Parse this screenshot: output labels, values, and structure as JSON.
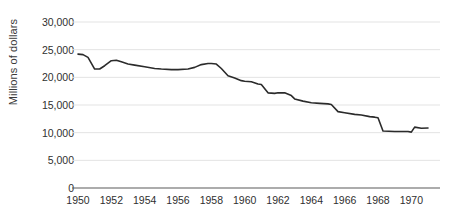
{
  "chart_data": {
    "type": "line",
    "title": "",
    "xlabel": "",
    "ylabel": "Millions of dollars",
    "xlim": [
      1950,
      1971
    ],
    "ylim": [
      0,
      30000
    ],
    "yticks": [
      0,
      5000,
      10000,
      15000,
      20000,
      25000,
      30000
    ],
    "ytick_labels": [
      "0",
      "5,000",
      "10,000",
      "15,000",
      "20,000",
      "25,000",
      "30,000"
    ],
    "xticks": [
      1950,
      1952,
      1954,
      1956,
      1958,
      1960,
      1962,
      1964,
      1966,
      1968,
      1970
    ],
    "xtick_labels": [
      "1950",
      "1952",
      "1954",
      "1956",
      "1958",
      "1960",
      "1962",
      "1964",
      "1966",
      "1968",
      "1970"
    ],
    "grid": "horizontal",
    "legend": "none",
    "line_color": "#2b2b2b",
    "grid_color": "#e3e3e3",
    "axis_color": "#5a5a5a",
    "series": [
      {
        "name": "Millions of dollars",
        "x": [
          1950.0,
          1950.3,
          1950.6,
          1951.0,
          1951.3,
          1951.6,
          1952.0,
          1952.3,
          1952.6,
          1953.0,
          1953.4,
          1954.0,
          1954.6,
          1955.0,
          1955.6,
          1956.0,
          1956.6,
          1957.0,
          1957.4,
          1957.8,
          1958.0,
          1958.3,
          1958.6,
          1959.0,
          1959.4,
          1959.8,
          1960.0,
          1960.4,
          1960.8,
          1961.0,
          1961.4,
          1961.8,
          1962.0,
          1962.4,
          1962.8,
          1963.0,
          1963.5,
          1964.0,
          1964.5,
          1965.0,
          1965.2,
          1965.6,
          1966.0,
          1966.6,
          1967.0,
          1967.5,
          1967.8,
          1968.0,
          1968.3,
          1969.0,
          1969.8,
          1970.0,
          1970.2,
          1970.6,
          1971.0
        ],
        "y": [
          24200,
          24100,
          23600,
          21500,
          21500,
          22100,
          23000,
          23100,
          22800,
          22400,
          22200,
          21900,
          21600,
          21500,
          21400,
          21400,
          21500,
          21800,
          22300,
          22500,
          22500,
          22400,
          21600,
          20300,
          19900,
          19400,
          19300,
          19200,
          18800,
          18700,
          17200,
          17100,
          17200,
          17200,
          16700,
          16100,
          15700,
          15400,
          15300,
          15200,
          15100,
          13800,
          13600,
          13300,
          13200,
          12900,
          12800,
          12700,
          10300,
          10200,
          10200,
          10100,
          11000,
          10800,
          10850
        ]
      }
    ]
  }
}
